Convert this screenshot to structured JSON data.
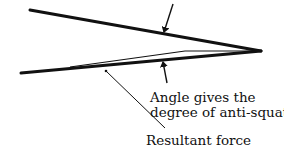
{
  "diagram": {
    "type": "anti-squat force diagram",
    "colors": {
      "line": "#111111",
      "background": "#ffffff"
    },
    "labels": {
      "angle_line1": "Angle gives the",
      "angle_line2": "degree of anti-squat",
      "resultant": "Resultant force"
    },
    "elements": [
      {
        "id": "upper-line",
        "from": [
          30,
          10
        ],
        "to": [
          261,
          51
        ]
      },
      {
        "id": "lower-line",
        "from": [
          21,
          73
        ],
        "to": [
          261,
          51
        ]
      },
      {
        "id": "resultant-force-line",
        "points": [
          [
            70,
            67
          ],
          [
            185,
            51
          ],
          [
            250,
            51
          ]
        ]
      },
      {
        "id": "angle-arrow-top",
        "from": [
          173,
          4
        ],
        "to": [
          164,
          33
        ]
      },
      {
        "id": "angle-arrow-bottom",
        "from": [
          167,
          83
        ],
        "to": [
          163,
          61
        ]
      },
      {
        "id": "resultant-leader",
        "from": [
          106,
          71
        ],
        "to": [
          165,
          128
        ]
      }
    ]
  }
}
